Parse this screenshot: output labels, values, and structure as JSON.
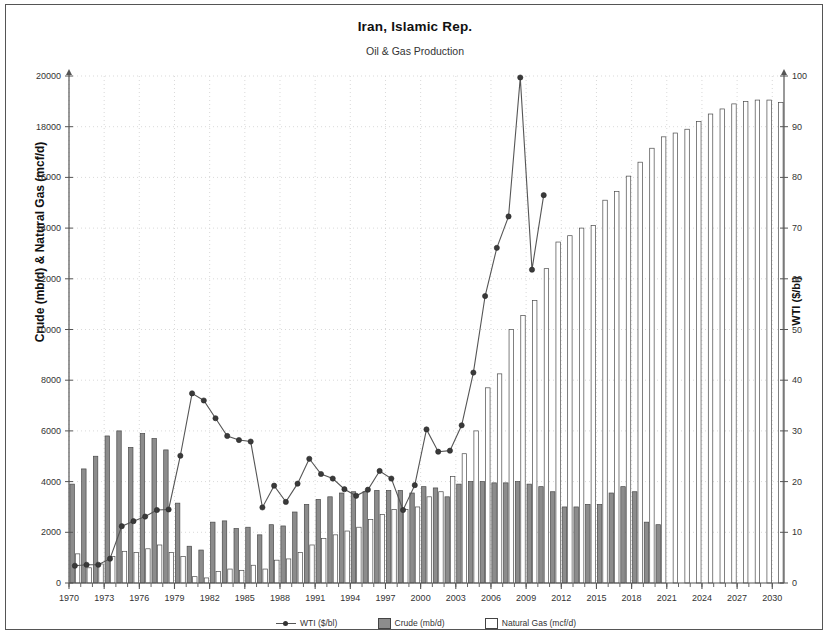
{
  "chart_data": {
    "type": "bar",
    "title": "Iran, Islamic Rep.",
    "subtitle": "Oil & Gas Production",
    "xlabel": "",
    "ylabel": "Crude (mb/d) & Natural Gas (mcf/d)",
    "y2label": "WTI ($/bl)",
    "ylim": [
      0,
      20000
    ],
    "y2lim": [
      0,
      100
    ],
    "xlim": [
      1970,
      2030
    ],
    "grid": true,
    "legend_position": "bottom-center",
    "y_ticks": [
      0,
      2000,
      4000,
      6000,
      8000,
      10000,
      12000,
      14000,
      16000,
      18000,
      20000
    ],
    "y2_ticks": [
      0,
      10,
      20,
      30,
      40,
      50,
      60,
      70,
      80,
      90,
      100
    ],
    "x_ticks": [
      1970,
      1973,
      1976,
      1979,
      1982,
      1985,
      1988,
      1991,
      1994,
      1997,
      2000,
      2003,
      2006,
      2009,
      2012,
      2015,
      2018,
      2021,
      2024,
      2027,
      2030
    ],
    "x": [
      1970,
      1971,
      1972,
      1973,
      1974,
      1975,
      1976,
      1977,
      1978,
      1979,
      1980,
      1981,
      1982,
      1983,
      1984,
      1985,
      1986,
      1987,
      1988,
      1989,
      1990,
      1991,
      1992,
      1993,
      1994,
      1995,
      1996,
      1997,
      1998,
      1999,
      2000,
      2001,
      2002,
      2003,
      2004,
      2005,
      2006,
      2007,
      2008,
      2009,
      2010,
      2011,
      2012,
      2013,
      2014,
      2015,
      2016,
      2017,
      2018,
      2019,
      2020,
      2021,
      2022,
      2023,
      2024,
      2025,
      2026,
      2027,
      2028,
      2029,
      2030
    ],
    "series": [
      {
        "name": "Crude (mb/d)",
        "type": "bar",
        "color": "#8c8c8c",
        "axis": "left",
        "values": [
          3900,
          4500,
          5000,
          5800,
          6000,
          5350,
          5900,
          5700,
          5250,
          3150,
          1450,
          1300,
          2400,
          2450,
          2150,
          2200,
          1900,
          2300,
          2250,
          2800,
          3100,
          3300,
          3400,
          3550,
          3600,
          3600,
          3650,
          3650,
          3650,
          3550,
          3800,
          3750,
          3400,
          3900,
          4000,
          4000,
          3950,
          3950,
          4000,
          3900,
          3800,
          3600,
          3000,
          3000,
          3100,
          3100,
          3550,
          3800,
          3600,
          2400,
          2300,
          null,
          null,
          null,
          null,
          null,
          null,
          null,
          null,
          null,
          null
        ]
      },
      {
        "name": "Natural Gas (mcf/d)",
        "type": "bar",
        "color": "#ffffff",
        "axis": "left",
        "values": [
          1150,
          600,
          750,
          1050,
          1250,
          1200,
          1350,
          1500,
          1200,
          1050,
          250,
          200,
          450,
          550,
          500,
          700,
          550,
          900,
          950,
          1200,
          1500,
          1750,
          1900,
          2050,
          2200,
          2500,
          2700,
          2900,
          2900,
          3000,
          3400,
          3600,
          4200,
          5100,
          6000,
          7700,
          8250,
          10000,
          10550,
          11150,
          12400,
          13450,
          13700,
          14000,
          14100,
          15100,
          15450,
          16050,
          16600,
          17150,
          17600,
          17750,
          17900,
          18200,
          18500,
          18700,
          18900,
          19000,
          19050,
          19050,
          18950
        ]
      },
      {
        "name": "WTI ($/bl)",
        "type": "line",
        "color": "#555555",
        "marker": "circle",
        "axis": "right",
        "values": [
          3.4,
          3.6,
          3.6,
          4.8,
          11.2,
          12.2,
          13.1,
          14.4,
          14.5,
          25.1,
          37.4,
          36.0,
          32.5,
          29.0,
          28.2,
          27.9,
          14.9,
          19.2,
          16.0,
          19.6,
          24.5,
          21.5,
          20.6,
          18.5,
          17.2,
          18.4,
          22.1,
          20.6,
          14.4,
          19.3,
          30.3,
          25.9,
          26.1,
          31.1,
          41.5,
          56.6,
          66.1,
          72.3,
          99.7,
          61.8,
          76.5,
          null,
          null,
          null,
          null,
          null,
          null,
          null,
          null,
          null,
          null,
          null,
          null,
          null,
          null,
          null,
          null,
          null,
          null,
          null,
          null
        ]
      }
    ]
  },
  "legend": {
    "items": [
      {
        "label": "WTI ($/bl)",
        "marker": "line-marker"
      },
      {
        "label": "Crude (mb/d)",
        "marker": "gray-square"
      },
      {
        "label": "Natural Gas (mcf/d)",
        "marker": "white-square"
      }
    ]
  }
}
